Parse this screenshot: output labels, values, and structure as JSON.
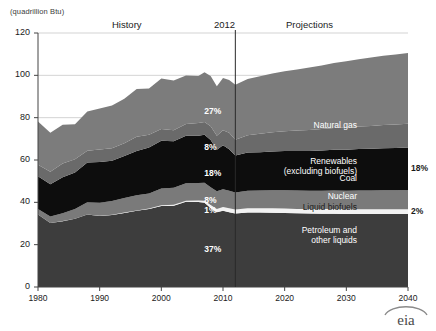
{
  "axis": {
    "unit_label": "(quadrillion Btu)",
    "y_ticks": [
      "0",
      "20",
      "40",
      "60",
      "80",
      "100",
      "120"
    ],
    "y_values": [
      0,
      20,
      40,
      60,
      80,
      100,
      120
    ],
    "x_ticks": [
      "1980",
      "1990",
      "2000",
      "2010",
      "2020",
      "2030",
      "2040"
    ],
    "x_values": [
      1980,
      1990,
      2000,
      2010,
      2020,
      2030,
      2040
    ]
  },
  "annotations": {
    "history": "History",
    "projections": "Projections",
    "divider_year": "2012"
  },
  "series_labels": {
    "natural_gas": "Natural gas",
    "renewables_line1": "Renewables",
    "renewables_line2": "(excluding biofuels)",
    "coal": "Coal",
    "nuclear": "Nuclear",
    "liquid_biofuels": "Liquid biofuels",
    "petroleum_line1": "Petroleum and",
    "petroleum_line2": "other liquids"
  },
  "pct_2012": {
    "natural_gas": "27%",
    "renewables": "8%",
    "coal": "18%",
    "nuclear": "8%",
    "liquid_biofuels": "1%",
    "petroleum": "37%"
  },
  "pct_2040": {
    "natural_gas": "30%",
    "renewables": "10%",
    "coal": "18%",
    "nuclear": "8%",
    "liquid_biofuels": "2%",
    "petroleum": "32%"
  },
  "logo": {
    "text": "eia"
  },
  "colors": {
    "natural_gas": "#7c7c7c",
    "renewables": "#6a6a6a",
    "coal": "#0d0d0d",
    "nuclear": "#7a7a7a",
    "liquid_biofuels": "#f2f2f2",
    "petroleum": "#3d3d3d",
    "gridline": "#c8c8c8",
    "axis": "#444444",
    "divider": "#2a2a2a",
    "background": "#ffffff"
  },
  "chart_data": {
    "type": "area",
    "title": "",
    "xlabel": "",
    "ylabel": "(quadrillion Btu)",
    "ylim": [
      0,
      120
    ],
    "xlim": [
      1980,
      2040
    ],
    "grid": true,
    "legend": "inline-right",
    "stacked": true,
    "history_range": [
      1980,
      2012
    ],
    "projection_range": [
      2012,
      2040
    ],
    "x": [
      1980,
      1982,
      1984,
      1986,
      1988,
      1990,
      1992,
      1994,
      1996,
      1998,
      2000,
      2002,
      2004,
      2006,
      2007,
      2008,
      2009,
      2010,
      2011,
      2012,
      2014,
      2016,
      2018,
      2020,
      2022,
      2024,
      2026,
      2028,
      2030,
      2032,
      2034,
      2036,
      2038,
      2040
    ],
    "series": [
      {
        "name": "Petroleum and other liquids",
        "color": "#3d3d3d",
        "values": [
          34.2,
          30.2,
          31.1,
          32.2,
          34.2,
          33.6,
          34.0,
          35.0,
          36.0,
          36.9,
          38.3,
          38.4,
          40.3,
          40.1,
          39.8,
          37.3,
          35.3,
          36.0,
          35.3,
          34.7,
          35.2,
          35.2,
          35.1,
          35.0,
          34.8,
          34.7,
          34.6,
          34.6,
          34.5,
          34.5,
          34.5,
          34.5,
          34.5,
          34.5
        ]
      },
      {
        "name": "Liquid biofuels",
        "color": "#f2f2f2",
        "values": [
          0.0,
          0.0,
          0.1,
          0.1,
          0.1,
          0.1,
          0.1,
          0.2,
          0.2,
          0.2,
          0.3,
          0.4,
          0.5,
          0.8,
          1.0,
          1.4,
          1.6,
          1.8,
          1.9,
          1.9,
          2.0,
          2.0,
          2.1,
          2.1,
          2.1,
          2.1,
          2.2,
          2.2,
          2.2,
          2.2,
          2.2,
          2.2,
          2.2,
          2.2
        ]
      },
      {
        "name": "Nuclear",
        "color": "#7a7a7a",
        "values": [
          2.7,
          3.1,
          3.6,
          4.5,
          5.7,
          6.1,
          6.5,
          6.8,
          7.1,
          7.1,
          7.9,
          8.1,
          8.2,
          8.2,
          8.4,
          8.4,
          8.3,
          8.4,
          8.3,
          8.1,
          8.3,
          8.4,
          8.5,
          8.6,
          8.7,
          8.7,
          8.7,
          8.8,
          8.8,
          8.9,
          8.9,
          9.0,
          9.0,
          9.1
        ]
      },
      {
        "name": "Coal",
        "color": "#0d0d0d",
        "values": [
          15.4,
          15.3,
          17.1,
          17.3,
          18.8,
          19.2,
          19.1,
          19.9,
          21.0,
          21.7,
          22.6,
          21.9,
          22.5,
          22.4,
          22.7,
          22.4,
          19.7,
          20.8,
          19.6,
          17.4,
          18.0,
          18.1,
          18.3,
          18.5,
          18.6,
          18.8,
          19.0,
          19.2,
          19.4,
          19.6,
          19.7,
          19.9,
          20.0,
          20.1
        ]
      },
      {
        "name": "Renewables (excluding biofuels)",
        "color": "#6a6a6a",
        "values": [
          5.5,
          5.9,
          6.4,
          6.2,
          5.6,
          6.0,
          5.9,
          6.0,
          6.7,
          6.0,
          5.6,
          5.3,
          5.5,
          6.0,
          6.0,
          6.4,
          6.6,
          7.1,
          7.8,
          7.5,
          8.2,
          8.7,
          9.1,
          9.4,
          9.7,
          9.9,
          10.1,
          10.3,
          10.5,
          10.6,
          10.8,
          10.9,
          11.1,
          11.2
        ]
      },
      {
        "name": "Natural gas",
        "color": "#7c7c7c",
        "values": [
          20.4,
          18.4,
          18.4,
          16.6,
          18.5,
          19.3,
          20.1,
          21.0,
          22.6,
          21.9,
          23.8,
          23.5,
          22.9,
          22.2,
          23.6,
          23.8,
          23.4,
          24.6,
          24.9,
          26.0,
          26.6,
          27.2,
          27.8,
          28.3,
          28.9,
          29.5,
          30.1,
          30.7,
          31.3,
          31.8,
          32.3,
          32.7,
          33.1,
          33.4
        ]
      }
    ],
    "totals": [
      78.2,
      72.9,
      76.7,
      76.9,
      82.9,
      84.3,
      85.7,
      88.9,
      93.6,
      93.8,
      98.5,
      97.6,
      99.9,
      99.7,
      101.5,
      99.7,
      94.9,
      98.7,
      97.8,
      95.6,
      98.3,
      99.6,
      100.9,
      101.9,
      102.8,
      103.7,
      104.7,
      105.8,
      106.7,
      107.6,
      108.4,
      109.2,
      109.9,
      110.5
    ]
  }
}
